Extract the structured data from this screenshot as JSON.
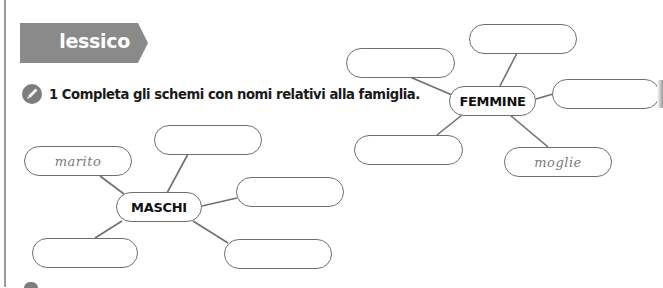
{
  "section_banner": {
    "label": "lessico",
    "color": "#8a8a8a"
  },
  "exercise": {
    "icon": "pencil-icon",
    "number": "1",
    "instruction": "1 Completa gli schemi con nomi relativi alla famiglia."
  },
  "diagrams": {
    "maschi": {
      "center": "MASCHI",
      "boxes": [
        {
          "id": "m1",
          "value": "marito"
        },
        {
          "id": "m2",
          "value": ""
        },
        {
          "id": "m3",
          "value": ""
        },
        {
          "id": "m4",
          "value": ""
        },
        {
          "id": "m5",
          "value": ""
        }
      ]
    },
    "femmine": {
      "center": "FEMMINE",
      "boxes": [
        {
          "id": "f1",
          "value": ""
        },
        {
          "id": "f2",
          "value": ""
        },
        {
          "id": "f3",
          "value": ""
        },
        {
          "id": "f4",
          "value": ""
        },
        {
          "id": "f5",
          "value": "moglie"
        }
      ]
    }
  },
  "colors": {
    "outline": "#6f6f6f",
    "banner": "#8a8a8a",
    "text": "#1a1a1a",
    "handwriting": "#7a7a7a"
  }
}
